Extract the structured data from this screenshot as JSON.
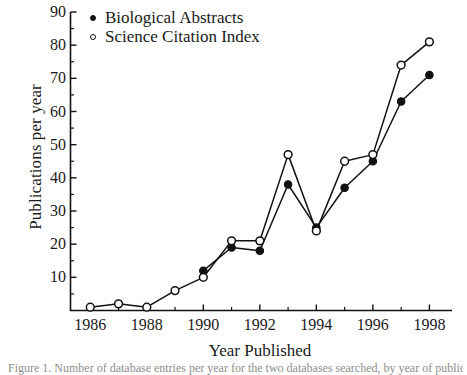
{
  "figure": {
    "background": "#ffffff",
    "ink_color": "#111111"
  },
  "caption": {
    "text": "Figure 1. Number of database entries per year for the two databases searched, by year of publication."
  },
  "chart_data": {
    "type": "line",
    "title": "",
    "xlabel": "Year Published",
    "ylabel": "Publications per year",
    "x": [
      1986,
      1987,
      1988,
      1989,
      1990,
      1991,
      1992,
      1993,
      1994,
      1995,
      1996,
      1997,
      1998
    ],
    "xlim": [
      1985.3,
      1998.8
    ],
    "ylim": [
      0,
      90
    ],
    "grid": false,
    "legend_position": "top-left-inside",
    "x_tick_labels": [
      "1986",
      "1988",
      "1990",
      "1992",
      "1994",
      "1996",
      "1998"
    ],
    "x_tick_values": [
      1986,
      1988,
      1990,
      1992,
      1994,
      1996,
      1998
    ],
    "x_minor_tick_values": [
      1987,
      1989,
      1991,
      1993,
      1995,
      1997
    ],
    "y_tick_labels": [
      "10",
      "20",
      "30",
      "40",
      "50",
      "60",
      "70",
      "80",
      "90"
    ],
    "y_tick_values": [
      10,
      20,
      30,
      40,
      50,
      60,
      70,
      80,
      90
    ],
    "y_minor_tick_values": [
      5,
      15,
      25,
      35,
      45,
      55,
      65,
      75,
      85
    ],
    "series": [
      {
        "name": "Biological Abstracts",
        "marker": "filled-circle",
        "color": "#111111",
        "x": [
          1990,
          1991,
          1992,
          1993,
          1994,
          1995,
          1996,
          1997,
          1998
        ],
        "values": [
          12,
          19,
          18,
          38,
          25,
          37,
          45,
          63,
          71
        ]
      },
      {
        "name": "Science Citation Index",
        "marker": "open-circle",
        "color": "#111111",
        "x": [
          1986,
          1987,
          1988,
          1989,
          1990,
          1991,
          1992,
          1993,
          1994,
          1995,
          1996,
          1997,
          1998
        ],
        "values": [
          1,
          2,
          1,
          6,
          10,
          21,
          21,
          47,
          24,
          45,
          47,
          74,
          81
        ]
      }
    ]
  }
}
